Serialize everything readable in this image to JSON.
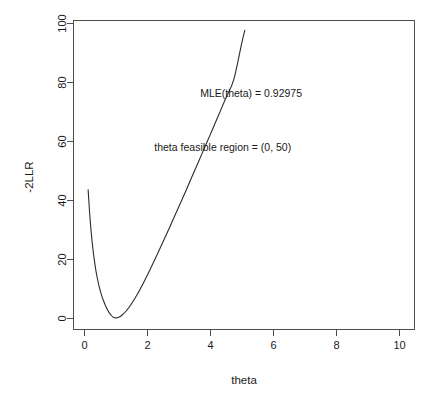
{
  "chart_data": {
    "type": "line",
    "title": "",
    "subtitle": "",
    "xlabel": "theta",
    "ylabel": "-2LLR",
    "xlim": [
      -0.35,
      10.5
    ],
    "ylim": [
      -4,
      101
    ],
    "grid": false,
    "legend": null,
    "xticks": [
      0,
      2,
      4,
      6,
      8,
      10
    ],
    "xtick_labels": [
      "0",
      "2",
      "4",
      "6",
      "8",
      "10"
    ],
    "yticks": [
      0,
      20,
      40,
      60,
      80,
      100
    ],
    "ytick_labels": [
      "0",
      "20",
      "40",
      "60",
      "80",
      "100"
    ],
    "annotations": [
      {
        "name": "mle-annotation",
        "text": "MLE(theta) = 0.92975",
        "x": 5.3,
        "y": 75.0
      },
      {
        "name": "feasible-region-annotation",
        "text": "theta feasible region = (0, 50)",
        "x": 4.4,
        "y": 56.5
      }
    ],
    "series": [
      {
        "name": "-2LLR curve",
        "color": "#2b2b2b",
        "x": [
          0.13,
          0.18,
          0.23,
          0.28,
          0.33,
          0.38,
          0.43,
          0.48,
          0.55,
          0.62,
          0.7,
          0.78,
          0.86,
          0.93,
          1.0,
          1.1,
          1.2,
          1.35,
          1.5,
          1.7,
          1.9,
          2.1,
          2.3,
          2.5,
          2.75,
          3.0,
          3.25,
          3.5,
          3.75,
          4.0,
          4.25,
          4.5,
          4.75,
          5.0,
          5.1
        ],
        "y": [
          43.5,
          35.3,
          28.8,
          23.6,
          19.4,
          15.9,
          13.1,
          10.7,
          8.0,
          5.8,
          3.8,
          2.2,
          1.0,
          0.3,
          0.1,
          0.3,
          1.0,
          2.6,
          4.8,
          8.3,
          12.3,
          16.6,
          21.1,
          25.7,
          31.6,
          37.6,
          43.6,
          49.8,
          55.9,
          62.1,
          68.3,
          74.6,
          80.8,
          93.0,
          97.5
        ]
      }
    ]
  },
  "plot_geometry": {
    "box_left": 73,
    "box_right": 415,
    "box_top": 20,
    "box_bottom": 330
  }
}
